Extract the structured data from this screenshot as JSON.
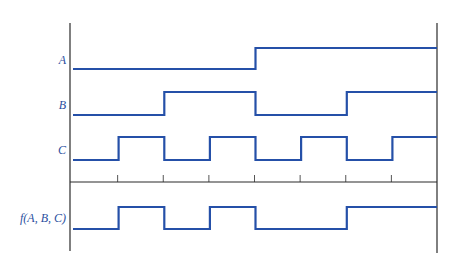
{
  "diagram": {
    "type": "timing-diagram",
    "colors": {
      "signal": "#2550a8",
      "axis": "#2b2b2b",
      "label": "#2a4fa0"
    },
    "time_intervals": 8,
    "signals": [
      {
        "name": "A",
        "label": "A",
        "values": [
          0,
          0,
          0,
          0,
          1,
          1,
          1,
          1
        ]
      },
      {
        "name": "B",
        "label": "B",
        "values": [
          0,
          0,
          1,
          1,
          0,
          0,
          1,
          1
        ]
      },
      {
        "name": "C",
        "label": "C",
        "values": [
          0,
          1,
          0,
          1,
          0,
          1,
          0,
          1
        ]
      },
      {
        "name": "f",
        "label": "f(A, B, C)",
        "values": [
          0,
          1,
          0,
          1,
          0,
          0,
          1,
          1
        ]
      }
    ]
  }
}
